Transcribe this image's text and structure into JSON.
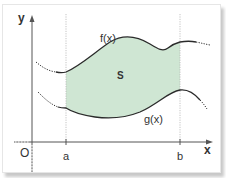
{
  "diagram": {
    "labels": {
      "y_axis": "y",
      "x_axis": "x",
      "origin": "O",
      "a": "a",
      "b": "b",
      "upper_curve": "f(x)",
      "lower_curve": "g(x)",
      "region": "S"
    },
    "colors": {
      "region_fill": "#cfe6d3",
      "curve": "#2b2b2b",
      "axis": "#555555",
      "guide": "#b0b0b0"
    }
  }
}
